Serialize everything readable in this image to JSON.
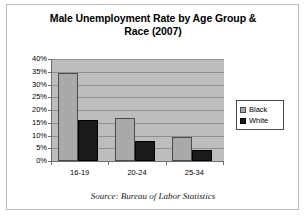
{
  "chart_data": {
    "type": "bar",
    "title": "Male Unemployment Rate by Age Group & Race (2007)",
    "title_line1": "Male Unemployment Rate by Age Group &",
    "title_line2": "Race (2007)",
    "xlabel": "",
    "ylabel": "",
    "categories": [
      "16-19",
      "20-24",
      "25-34"
    ],
    "series": [
      {
        "name": "Black",
        "values": [
          34.5,
          17,
          9.5
        ],
        "color": "#a9a9a9"
      },
      {
        "name": "White",
        "values": [
          16,
          8,
          4.5
        ],
        "color": "#1a1a1a"
      }
    ],
    "ylim": [
      0,
      40
    ],
    "y_ticks": [
      0,
      5,
      10,
      15,
      20,
      25,
      30,
      35,
      40
    ],
    "y_tick_labels": [
      "0%",
      "5%",
      "10%",
      "15%",
      "20%",
      "25%",
      "30%",
      "35%",
      "40%"
    ],
    "grid": true,
    "legend_position": "right",
    "plot_background": "#bdbdbd",
    "figure_background": "#ffffff",
    "source_note": "Source:  Bureau of Labor Statistics"
  }
}
